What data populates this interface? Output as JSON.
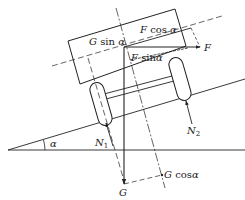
{
  "diagram": {
    "title": "",
    "colors": {
      "line": "#222222",
      "background": "#ffffff"
    },
    "labels": {
      "g_sin_alpha": {
        "var": "G",
        "fn": " sin ",
        "ang": "α"
      },
      "f_cos_alpha": {
        "var": "F",
        "fn": " cos ",
        "ang": "α"
      },
      "f_sin_alpha": {
        "var": "F",
        "fn": " sin",
        "ang": "α"
      },
      "f": "F",
      "n1": {
        "var": "N",
        "sub": "1"
      },
      "n2": {
        "var": "N",
        "sub": "2"
      },
      "g": "G",
      "g_cos_alpha": {
        "var": "G",
        "fn": " cos",
        "ang": "α"
      },
      "alpha": "α"
    }
  }
}
